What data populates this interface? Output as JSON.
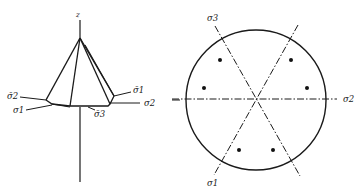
{
  "figure": {
    "left_panel": {
      "name": "pyramid-yield-surface",
      "axis_label": "z",
      "labels": {
        "sigma_bar_2": "σ̄2",
        "sigma_1": "σ1",
        "sigma_bar_1": "σ̄1",
        "sigma_2": "σ2",
        "sigma_bar_3": "σ̄3"
      }
    },
    "right_panel": {
      "name": "deviatoric-plane-circle",
      "labels": {
        "sigma_3": "σ3",
        "sigma_2": "σ2",
        "sigma_1": "σ1"
      },
      "dot_count": 6
    }
  }
}
